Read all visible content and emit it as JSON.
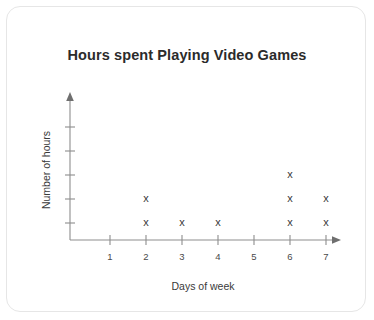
{
  "card": {
    "background": "#ffffff",
    "border_color": "#e6e6e6"
  },
  "chart_data": {
    "type": "scatter",
    "plot_style": "dot-plot",
    "title": "Hours spent Playing Video Games",
    "xlabel": "Days of week",
    "ylabel": "Number of hours",
    "categories": [
      "1",
      "2",
      "3",
      "4",
      "5",
      "6",
      "7"
    ],
    "x": [
      1,
      2,
      3,
      4,
      5,
      6,
      7
    ],
    "values": [
      0,
      2,
      1,
      1,
      0,
      3,
      2
    ],
    "marker": "x",
    "marker_color": "#3a3a3a",
    "axis_color": "#8d8d8d",
    "grid": false,
    "legend": false,
    "xlim": [
      0.5,
      7.5
    ],
    "ylim": [
      0,
      5
    ],
    "y_tick_count": 5,
    "y_tick_labels": [],
    "x_axis_arrow": true,
    "y_axis_arrow": true,
    "points": [
      {
        "x": 2,
        "stack": 1
      },
      {
        "x": 2,
        "stack": 2
      },
      {
        "x": 3,
        "stack": 1
      },
      {
        "x": 4,
        "stack": 1
      },
      {
        "x": 6,
        "stack": 1
      },
      {
        "x": 6,
        "stack": 2
      },
      {
        "x": 6,
        "stack": 3
      },
      {
        "x": 7,
        "stack": 1
      },
      {
        "x": 7,
        "stack": 2
      }
    ]
  }
}
